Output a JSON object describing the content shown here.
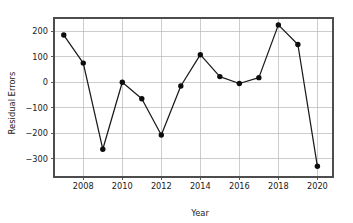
{
  "chart_data": {
    "type": "line",
    "title": "",
    "xlabel": "Year",
    "ylabel": "Residual Errors",
    "x": [
      2007,
      2008,
      2009,
      2010,
      2011,
      2012,
      2013,
      2014,
      2015,
      2016,
      2017,
      2018,
      2019,
      2020
    ],
    "values": [
      185,
      75,
      -263,
      0,
      -65,
      -207,
      -15,
      108,
      22,
      -5,
      18,
      225,
      148,
      -330
    ],
    "series": [
      {
        "name": "Residual Errors",
        "values": [
          185,
          75,
          -263,
          0,
          -65,
          -207,
          -15,
          108,
          22,
          -5,
          18,
          225,
          148,
          -330
        ]
      }
    ],
    "xlim": [
      2006.5,
      2020.8
    ],
    "ylim": [
      -372,
      252
    ],
    "xticks": [
      2008,
      2010,
      2012,
      2014,
      2016,
      2018,
      2020
    ],
    "xticklabels": [
      "2008",
      "2010",
      "2012",
      "2014",
      "2016",
      "2018",
      "2020"
    ],
    "yticks": [
      200,
      100,
      0,
      -100,
      -200,
      -300
    ],
    "yticklabels": [
      "200",
      "100",
      "0",
      "−100",
      "−200",
      "−300"
    ],
    "grid": true,
    "legend": null,
    "marker": "circle",
    "line_color": "#1a1a1a",
    "marker_color": "#0d0d0d",
    "grid_color": "#b8b8b8",
    "background": "#ffffff"
  }
}
